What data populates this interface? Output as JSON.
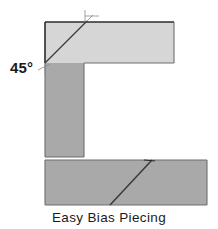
{
  "figure": {
    "title": "Easy Bias Piecing",
    "caption": "Easy Bias Piecing",
    "angle_label": "45°",
    "width": 218,
    "height": 229,
    "background_color": "#ffffff"
  },
  "colors": {
    "fabric_light": "#d6d6d6",
    "fabric_medium": "#a9a9a9",
    "outline_dark": "#2b2b2b",
    "outline_mid": "#6e6e6e",
    "seam_line": "#3a3a3a",
    "guide_line": "#8c8c8c",
    "text": "#1b1b1b"
  },
  "shapes": {
    "horizontal_strip": {
      "name": "horizontal-bias-strip",
      "fill": "#d6d6d6",
      "x": 45,
      "y": 22,
      "width": 129,
      "height": 41
    },
    "vertical_strip": {
      "name": "vertical-bias-strip",
      "fill": "#a9a9a9",
      "x": 45,
      "y": 63,
      "width": 39,
      "height": 94
    },
    "joined_strip": {
      "name": "joined-bias-strip",
      "fill": "#a9a9a9",
      "x": 45,
      "y": 160,
      "width": 162,
      "height": 45
    },
    "corner_seam": {
      "name": "corner-45-degree-seam",
      "x1": 45,
      "y1": 63,
      "x2": 87,
      "y2": 21
    },
    "corner_seam_extension": {
      "name": "seam-guide-extension",
      "x1": 87,
      "y1": 21,
      "x2": 93,
      "y2": 15
    },
    "joined_seam": {
      "name": "joined-strip-diagonal-seam",
      "x1": 152,
      "y1": 160,
      "x2": 110,
      "y2": 205
    },
    "tick_top": {
      "name": "top-alignment-tick",
      "x1": 85,
      "y1": 10,
      "x2": 85,
      "y2": 22
    },
    "tick_top_cross": {
      "name": "top-alignment-cross-tick",
      "x1": 85,
      "y1": 16,
      "x2": 99,
      "y2": 16
    },
    "tick_corner": {
      "name": "corner-alignment-tick",
      "x1": 38,
      "y1": 70,
      "x2": 50,
      "y2": 64
    },
    "tick_corner_short": {
      "name": "corner-alignment-short-tick",
      "x1": 45,
      "y1": 63,
      "x2": 45,
      "y2": 75
    }
  },
  "labels": {
    "angle": {
      "text": "45°",
      "x": 10,
      "y": 60
    },
    "caption": {
      "text": "Easy Bias Piecing",
      "y": 210
    }
  }
}
